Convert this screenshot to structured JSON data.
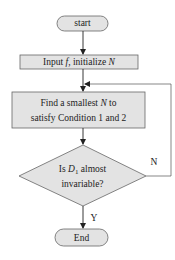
{
  "flowchart": {
    "nodes": [
      {
        "id": "start",
        "shape": "terminator",
        "label": "start"
      },
      {
        "id": "input",
        "shape": "process",
        "label_parts": [
          "Input ",
          "f",
          ", initialize ",
          "N"
        ]
      },
      {
        "id": "find",
        "shape": "process",
        "line1_parts": [
          "Find a smallest ",
          "N",
          " to"
        ],
        "line2": "satisfy Condition 1 and 2"
      },
      {
        "id": "decision",
        "shape": "decision",
        "line1_parts": [
          "Is ",
          "D",
          "1",
          " almost"
        ],
        "line2": "invariable?"
      },
      {
        "id": "end",
        "shape": "terminator",
        "label": "End"
      }
    ],
    "edges": [
      {
        "from": "start",
        "to": "input",
        "label": ""
      },
      {
        "from": "input",
        "to": "find",
        "label": ""
      },
      {
        "from": "find",
        "to": "decision",
        "label": ""
      },
      {
        "from": "decision",
        "to": "end",
        "label": "Y"
      },
      {
        "from": "decision",
        "to": "find",
        "label": "N"
      }
    ]
  },
  "colors": {
    "node_fill": "#e3e3e3",
    "stroke": "#666666",
    "arrow": "#222222"
  }
}
